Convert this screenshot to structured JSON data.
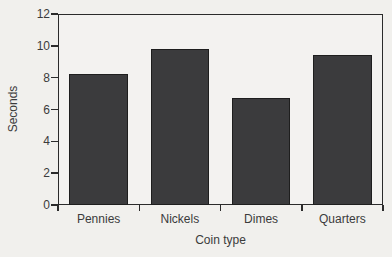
{
  "chart_data": {
    "type": "bar",
    "title": "",
    "categories": [
      "Pennies",
      "Nickels",
      "Dimes",
      "Quarters"
    ],
    "values": [
      8.2,
      9.8,
      6.7,
      9.4
    ],
    "xlabel": "Coin type",
    "ylabel": "Seconds",
    "ylim": [
      0,
      12
    ],
    "ytick_step": 2,
    "ytick_labels": [
      "0",
      "2",
      "4",
      "6",
      "8",
      "10",
      "12"
    ],
    "grid": false,
    "legend": "none",
    "colors": {
      "bar_fill": "#3b3b3d",
      "bar_border": "#1e1e1e",
      "axis": "#2b2b2b",
      "text": "#3b3b3b",
      "background": "#f1f0ed",
      "plot_background": "#f3f2f0"
    }
  }
}
